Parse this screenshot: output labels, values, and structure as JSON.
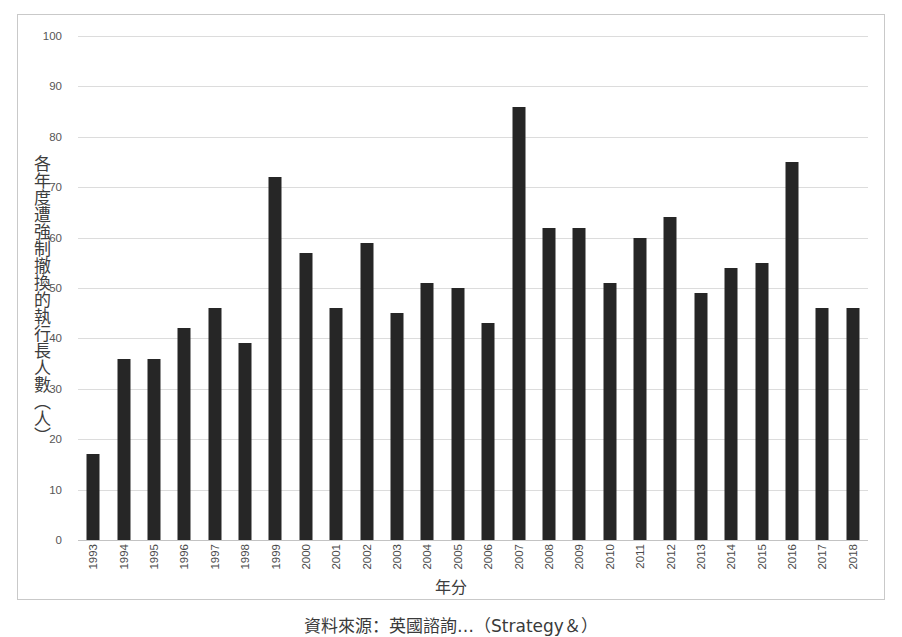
{
  "chart_data": {
    "type": "bar",
    "title": "",
    "xlabel": "年分",
    "ylabel": "各年度遭強制撤換的執行長人數（人）",
    "ylim": [
      0,
      100
    ],
    "ytick_step": 10,
    "grid": true,
    "legend": "none",
    "bar_color": "#262626",
    "categories": [
      "1993",
      "1994",
      "1995",
      "1996",
      "1997",
      "1998",
      "1999",
      "2000",
      "2001",
      "2002",
      "2003",
      "2004",
      "2005",
      "2006",
      "2007",
      "2008",
      "2009",
      "2010",
      "2011",
      "2012",
      "2013",
      "2014",
      "2015",
      "2016",
      "2017",
      "2018"
    ],
    "values": [
      17,
      36,
      36,
      42,
      46,
      39,
      72,
      57,
      46,
      59,
      45,
      51,
      50,
      43,
      86,
      62,
      62,
      51,
      60,
      64,
      49,
      54,
      55,
      75,
      46,
      46
    ],
    "yticks": [
      0,
      10,
      20,
      30,
      40,
      50,
      60,
      70,
      80,
      90,
      100
    ]
  },
  "caption": {
    "text": "資料來源：英國諮詢…（Strategy＆）"
  },
  "colors": {
    "bar": "#262626",
    "grid": "#dcdcdc",
    "frame": "#c9c9c9",
    "text": "#3d3d3d"
  }
}
